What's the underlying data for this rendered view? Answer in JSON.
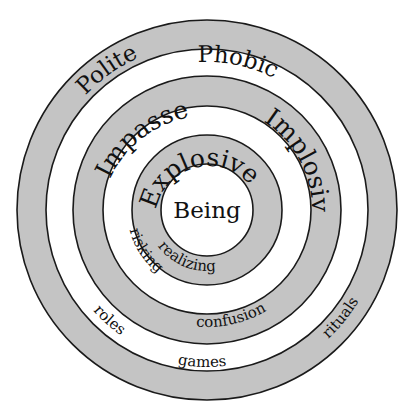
{
  "diagram": {
    "type": "concentric-rings",
    "colors": {
      "band": "#c4c4c4",
      "gap": "#ffffff",
      "stroke": "#1a1a1a",
      "text": "#111111"
    },
    "center_label": "Being",
    "layers": [
      {
        "name": "Polite",
        "sublabel": "rituals",
        "band": "outer-gray"
      },
      {
        "name": "Phobic",
        "sublabel": "roles / games",
        "band": "outer-white",
        "sublabels": [
          "roles",
          "games"
        ]
      },
      {
        "name": "Impasse",
        "sublabel": "confusion",
        "band": "middle-gray"
      },
      {
        "name": "Implosive",
        "sublabel": "risking",
        "band": "middle-white"
      },
      {
        "name": "Explosive",
        "sublabel": "realizing",
        "band": "inner-gray"
      }
    ],
    "labels": {
      "polite": "Polite",
      "phobic": "Phobic",
      "impasse": "Impasse",
      "implosive": "Implosive",
      "explosive": "Explosive",
      "being": "Being",
      "rituals": "rituals",
      "roles": "roles",
      "games": "games",
      "confusion": "confusion",
      "risking": "risking",
      "realizing": "realizing"
    }
  }
}
